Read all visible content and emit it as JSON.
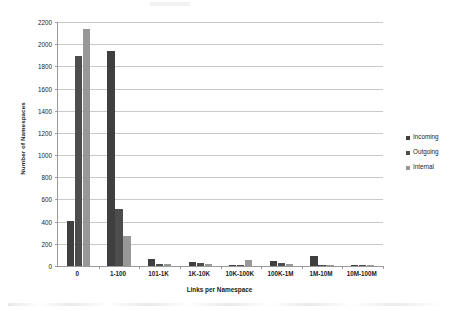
{
  "chart_data": {
    "type": "bar",
    "title": "",
    "xlabel": "Links per Namespace",
    "ylabel": "Number of Namespaces",
    "categories": [
      "0",
      "1-100",
      "101-1K",
      "1K-10K",
      "10K-100K",
      "100K-1M",
      "1M-10M",
      "10M-100M"
    ],
    "series": [
      {
        "name": "Incoming",
        "color": "#3f3f3f",
        "values": [
          410,
          1935,
          60,
          35,
          12,
          45,
          90,
          8
        ]
      },
      {
        "name": "Outgoing",
        "color": "#4d4d4d",
        "values": [
          1890,
          510,
          22,
          28,
          10,
          30,
          6,
          5
        ]
      },
      {
        "name": "Internal",
        "color": "#989898",
        "values": [
          2140,
          270,
          18,
          14,
          55,
          20,
          4,
          3
        ]
      }
    ],
    "ylim": [
      0,
      2200
    ],
    "yticks": [
      0,
      200,
      400,
      600,
      800,
      1000,
      1200,
      1400,
      1600,
      1800,
      2000,
      2200
    ],
    "grid": true,
    "legend_position": "right"
  },
  "legend": {
    "items": [
      {
        "label": "Incoming"
      },
      {
        "label": "Outgoing"
      },
      {
        "label": "Internal"
      }
    ]
  }
}
